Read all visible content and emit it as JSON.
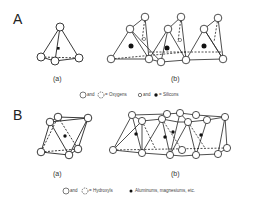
{
  "panels": [
    {
      "label": "A",
      "subfigures": [
        "(a)",
        "(b)"
      ],
      "legend": {
        "item1": "and",
        "item1_suffix": "= Oxygens",
        "item2": "and",
        "item2_suffix": "= Silicons"
      }
    },
    {
      "label": "B",
      "subfigures": [
        "(a)",
        "(b)"
      ],
      "legend": {
        "item1": "and",
        "item1_suffix": "= Hydroxyls",
        "item2_suffix": "Aluminums, magnesiums, etc."
      }
    }
  ]
}
